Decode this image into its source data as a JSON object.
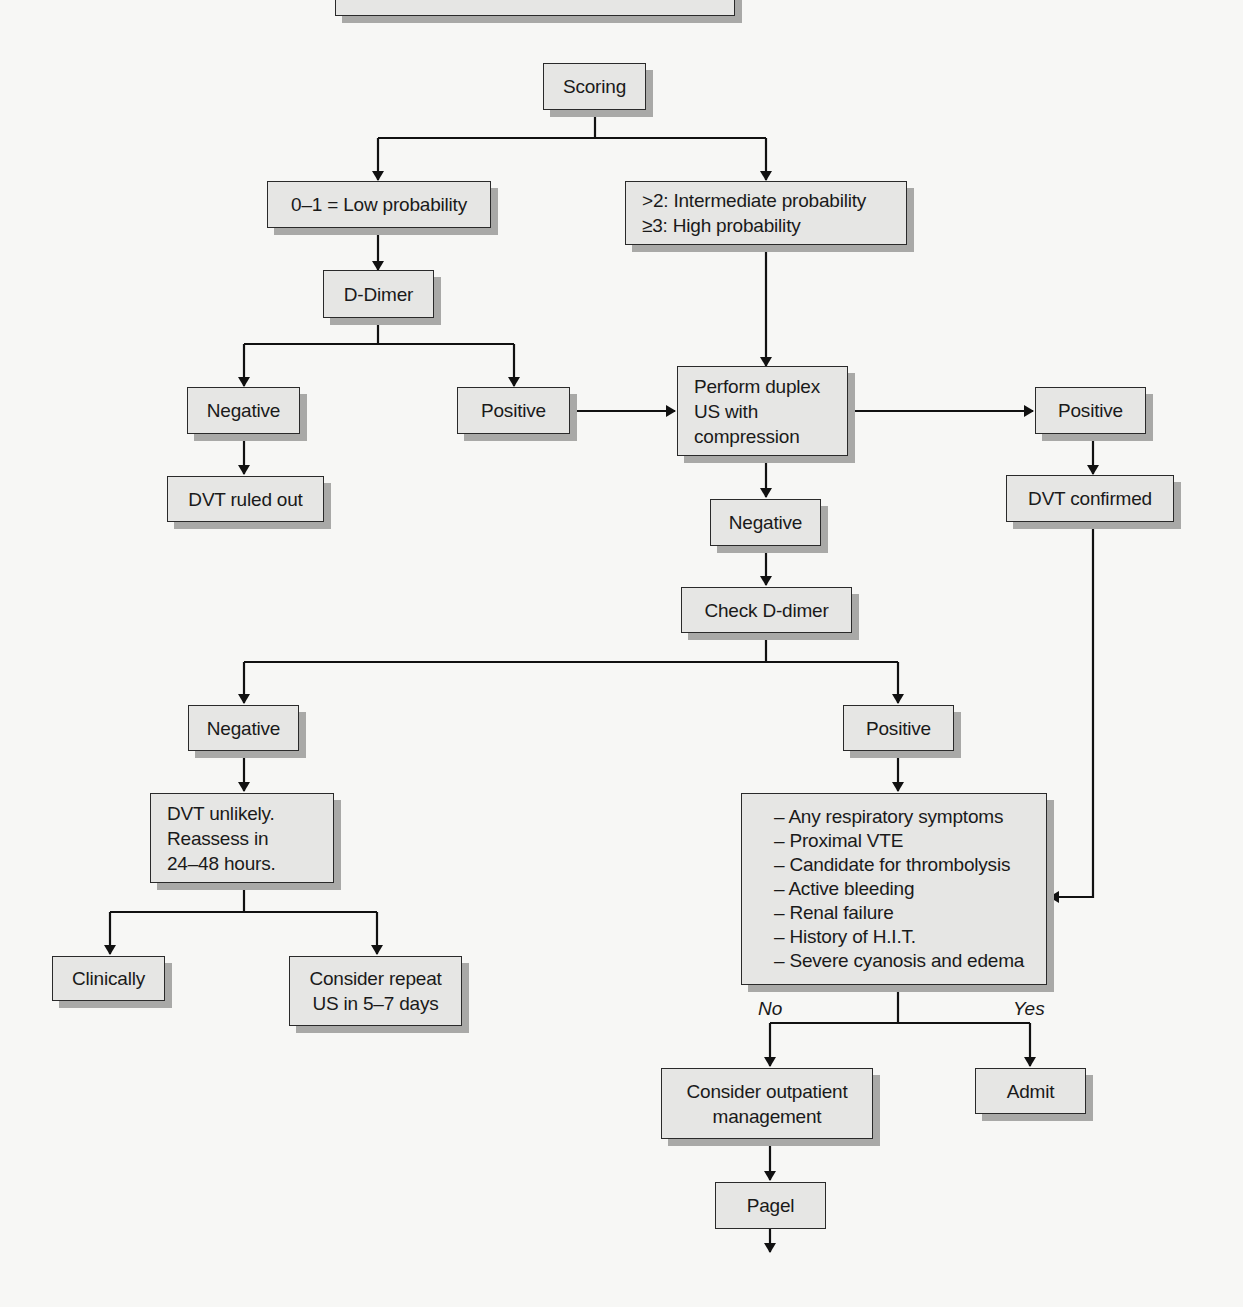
{
  "diagram": {
    "top_box_cutoff": {
      "text": ""
    },
    "nodes": {
      "scoring": {
        "text": "Scoring"
      },
      "low_prob": {
        "text": "0–1 = Low probability"
      },
      "high_prob": {
        "lines": [
          ">2: Intermediate probability",
          "≥3: High probability"
        ]
      },
      "d_dimer": {
        "text": "D-Dimer"
      },
      "dd_negative": {
        "text": "Negative"
      },
      "dd_positive": {
        "text": "Positive"
      },
      "dvt_ruled_out": {
        "text": "DVT ruled out"
      },
      "duplex": {
        "lines": [
          "Perform duplex",
          "US with",
          "compression"
        ]
      },
      "us_positive": {
        "text": "Positive"
      },
      "dvt_confirmed": {
        "text": "DVT confirmed"
      },
      "us_negative": {
        "text": "Negative"
      },
      "check_ddimer": {
        "text": "Check D-dimer"
      },
      "cd_negative": {
        "text": "Negative"
      },
      "cd_positive": {
        "text": "Positive"
      },
      "dvt_unlikely": {
        "lines": [
          "DVT unlikely.",
          "Reassess in",
          "24–48 hours."
        ]
      },
      "clinically": {
        "text": "Clinically"
      },
      "repeat_us": {
        "lines": [
          "Consider repeat",
          "US in 5–7 days"
        ]
      },
      "criteria": {
        "lines": [
          "– Any respiratory symptoms",
          "– Proximal VTE",
          "– Candidate for thrombolysis",
          "– Active bleeding",
          "– Renal failure",
          "– History of H.I.T.",
          "– Severe cyanosis and edema"
        ]
      },
      "outpatient": {
        "lines": [
          "Consider outpatient",
          "management"
        ]
      },
      "admit": {
        "text": "Admit"
      },
      "pagel": {
        "text": "Pagel"
      }
    },
    "edge_labels": {
      "no": "No",
      "yes": "Yes"
    },
    "colors": {
      "box_fill": "#e6e6e4",
      "box_border": "#2a2a2a",
      "shadow": "#a9a9a7",
      "line": "#111111",
      "background": "#f7f7f5"
    }
  }
}
